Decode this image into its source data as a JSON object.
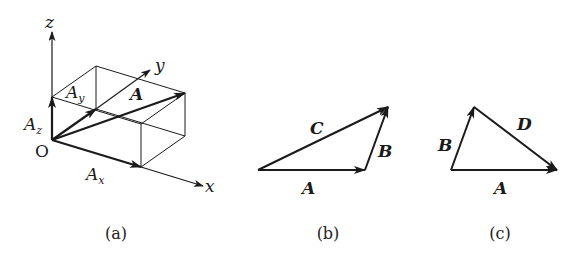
{
  "figure": {
    "panels": [
      {
        "id": "a",
        "caption": "(a)",
        "axes": {
          "x": "x",
          "y": "y",
          "z": "z",
          "origin": "O"
        },
        "components": {
          "ax": "A",
          "ax_sub": "x",
          "ay": "A",
          "ay_sub": "y",
          "az": "A",
          "az_sub": "z"
        },
        "vector": "A"
      },
      {
        "id": "b",
        "caption": "(b)",
        "vectors": {
          "a": "A",
          "b": "B",
          "c": "C"
        }
      },
      {
        "id": "c",
        "caption": "(c)",
        "vectors": {
          "a": "A",
          "b": "B",
          "d": "D"
        }
      }
    ],
    "colors": {
      "stroke": "#1a1a1a",
      "background": "#ffffff"
    }
  }
}
